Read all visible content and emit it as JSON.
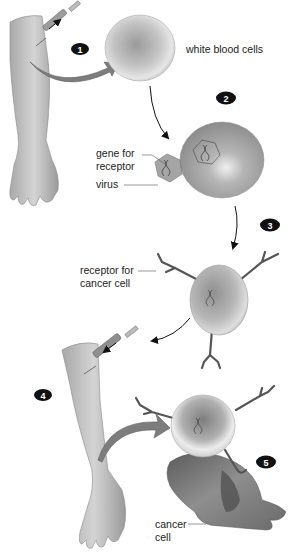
{
  "diagram": {
    "steps": [
      {
        "number": "1"
      },
      {
        "number": "2"
      },
      {
        "number": "3"
      },
      {
        "number": "4"
      },
      {
        "number": "5"
      }
    ],
    "labels": {
      "white_blood_cells": "white blood cells",
      "gene_for_receptor_line1": "gene for",
      "gene_for_receptor_line2": "receptor",
      "virus": "virus",
      "receptor_line1": "receptor for",
      "receptor_line2": "cancer cell",
      "cancer_line1": "cancer",
      "cancer_line2": "cell"
    },
    "colors": {
      "skin": "#c9c9c9",
      "cell_light": "#e8e8e8",
      "cell_dark": "#8f8f8f",
      "cancer_cell": "#6f6f6f",
      "arrow_fill": "#8a8a8a",
      "step_badge": "#111111"
    }
  }
}
